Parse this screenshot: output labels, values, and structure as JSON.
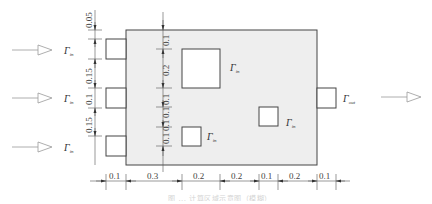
{
  "figure": {
    "domain_body": {
      "fill": "#eeeeee",
      "stroke": "#444444"
    },
    "labels": {
      "inlet_top": {
        "main": "Γ",
        "sub": "in"
      },
      "inlet_mid": {
        "main": "Γ",
        "sub": "in"
      },
      "inlet_bottom": {
        "main": "Γ",
        "sub": "in"
      },
      "outlet": {
        "main": "Γ",
        "sub": "out"
      },
      "obstacle_large": {
        "main": "Γ",
        "sub": "in"
      },
      "obstacle_small_left": {
        "main": "Γ",
        "sub": "in"
      },
      "obstacle_small_right": {
        "main": "Γ",
        "sub": "in"
      }
    },
    "left_dimensions": [
      "0.05",
      "0.15",
      "0.1",
      "0.15"
    ],
    "inner_vertical_dimensions": [
      "0.1",
      "0.2",
      "0.1",
      "0.1",
      "0.1",
      "0.1"
    ],
    "bottom_dimensions": [
      "0.1",
      "0.3",
      "0.2",
      "0.2",
      "0.1",
      "0.2",
      "0.1"
    ],
    "caption": "图 ... 计算区域示意图（模糊）"
  }
}
